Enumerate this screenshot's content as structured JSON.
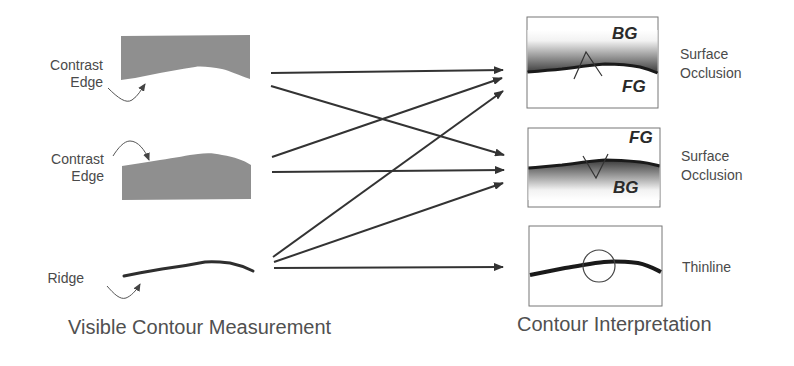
{
  "left_column": {
    "caption": "Visible Contour Measurement",
    "items": [
      {
        "label_line1": "Contrast",
        "label_line2": "Edge",
        "type": "contrast-edge-dark-above"
      },
      {
        "label_line1": "Contrast",
        "label_line2": "Edge",
        "type": "contrast-edge-dark-below"
      },
      {
        "label_line1": "Ridge",
        "label_line2": "",
        "type": "ridge"
      }
    ]
  },
  "right_column": {
    "caption": "Contour Interpretation",
    "items": [
      {
        "label_line1": "Surface",
        "label_line2": "Occlusion",
        "top_region": "BG",
        "bottom_region": "FG"
      },
      {
        "label_line1": "Surface",
        "label_line2": "Occlusion",
        "top_region": "FG",
        "bottom_region": "BG"
      },
      {
        "label_line1": "Thinline",
        "label_line2": ""
      }
    ]
  },
  "connections": [
    {
      "from": "Contrast Edge (1)",
      "to": "Surface Occlusion (1)"
    },
    {
      "from": "Contrast Edge (1)",
      "to": "Surface Occlusion (2)"
    },
    {
      "from": "Contrast Edge (2)",
      "to": "Surface Occlusion (1)"
    },
    {
      "from": "Contrast Edge (2)",
      "to": "Surface Occlusion (2)"
    },
    {
      "from": "Ridge",
      "to": "Surface Occlusion (1)"
    },
    {
      "from": "Ridge",
      "to": "Surface Occlusion (2)"
    },
    {
      "from": "Ridge",
      "to": "Thinline"
    }
  ],
  "colors": {
    "edge_fill": "#8f8f8f",
    "line": "#333333",
    "text": "#4a4a4a"
  }
}
